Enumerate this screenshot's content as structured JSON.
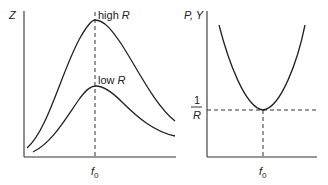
{
  "left_panel": {
    "y_axis_label": "Z",
    "x_tick_label_main": "f",
    "x_tick_label_sub": "0",
    "curves": [
      {
        "name": "high-r",
        "label_text": "high ",
        "label_var": "R"
      },
      {
        "name": "low-r",
        "label_text": "low ",
        "label_var": "R"
      }
    ]
  },
  "right_panel": {
    "y_axis_label": "P, Y",
    "y_tick_numerator": "1",
    "y_tick_denominator": "R",
    "x_tick_label_main": "f",
    "x_tick_label_sub": "0"
  },
  "colors": {
    "line": "#222222",
    "background": "#ffffff"
  }
}
